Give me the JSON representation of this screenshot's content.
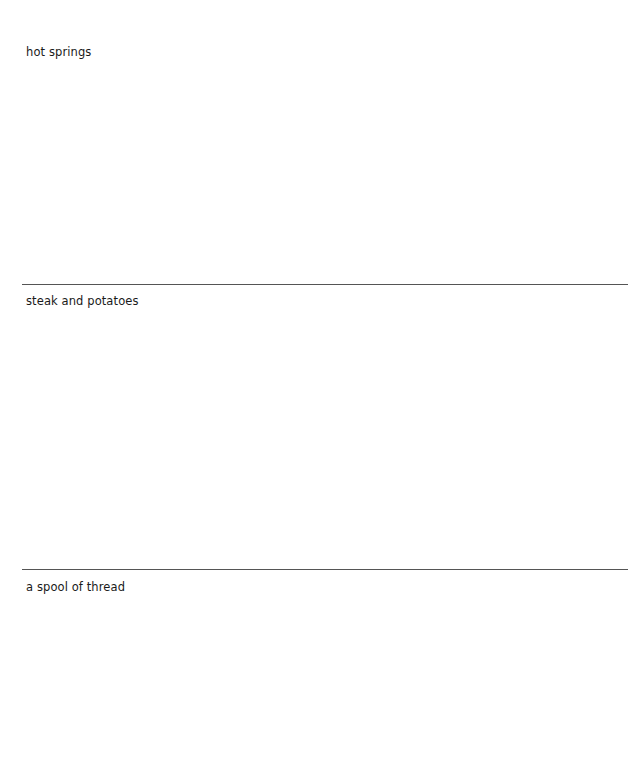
{
  "sections": [
    {
      "label": "hot springs"
    },
    {
      "label": "steak and potatoes"
    },
    {
      "label": "a spool of thread"
    }
  ],
  "colors": {
    "rule": "#555555",
    "text": "#1a1a1a",
    "background": "#ffffff"
  }
}
